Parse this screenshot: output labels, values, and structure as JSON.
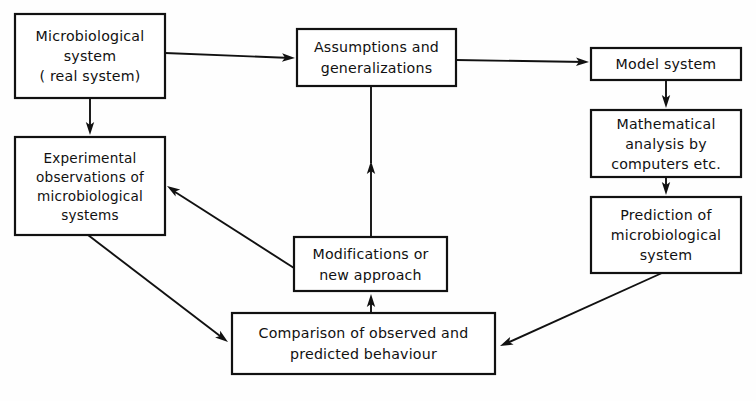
{
  "diagram": {
    "background_color": "#fefefe",
    "line_color": "#111111",
    "box_fill": "#ffffff",
    "nodes": [
      {
        "id": "microbiological-system",
        "lines": [
          "Microbiological",
          "system",
          "( real  system)"
        ],
        "x": 15,
        "y": 14,
        "w": 150,
        "h": 84
      },
      {
        "id": "assumptions-generalizations",
        "lines": [
          "Assumptions  and",
          "generalizations"
        ],
        "x": 297,
        "y": 29,
        "w": 159,
        "h": 57
      },
      {
        "id": "model-system",
        "lines": [
          "Model  system"
        ],
        "x": 591,
        "y": 48,
        "w": 150,
        "h": 32
      },
      {
        "id": "mathematical-analysis",
        "lines": [
          "Mathematical",
          "analysis by",
          "computers etc."
        ],
        "x": 591,
        "y": 110,
        "w": 150,
        "h": 67
      },
      {
        "id": "prediction-microbiological-system",
        "lines": [
          "Prediction of",
          "microbiological",
          "system"
        ],
        "x": 591,
        "y": 197,
        "w": 150,
        "h": 76
      },
      {
        "id": "experimental-observations",
        "lines": [
          "Experimental",
          "observations of",
          "microbiological",
          "systems"
        ],
        "x": 15,
        "y": 137,
        "w": 150,
        "h": 98
      },
      {
        "id": "modifications-new-approach",
        "lines": [
          "Modifications or",
          "new approach"
        ],
        "x": 294,
        "y": 237,
        "w": 153,
        "h": 54
      },
      {
        "id": "comparison-observed-predicted",
        "lines": [
          "Comparison of observed and",
          "predicted behaviour"
        ],
        "x": 232,
        "y": 313,
        "w": 263,
        "h": 61
      }
    ],
    "edges": [
      {
        "id": "edge-microbiological-to-assumptions",
        "from": "microbiological-system",
        "to": "assumptions-generalizations",
        "path": "M 165 53 L 291 58",
        "arrow_at": [
          295,
          58
        ],
        "arrow_angle": 2
      },
      {
        "id": "edge-microbiological-to-experimental",
        "from": "microbiological-system",
        "to": "experimental-observations",
        "path": "M 90 98 L 90 131",
        "arrow_at": [
          90,
          135
        ],
        "arrow_angle": 90
      },
      {
        "id": "edge-assumptions-to-model",
        "from": "assumptions-generalizations",
        "to": "model-system",
        "path": "M 456 60 L 585 62",
        "arrow_at": [
          589,
          62
        ],
        "arrow_angle": 1
      },
      {
        "id": "edge-model-to-mathematical",
        "from": "model-system",
        "to": "mathematical-analysis",
        "path": "M 666 80 L 666 104",
        "arrow_at": [
          666,
          108
        ],
        "arrow_angle": 90
      },
      {
        "id": "edge-mathematical-to-prediction",
        "from": "mathematical-analysis",
        "to": "prediction-microbiological-system",
        "path": "M 666 177 L 666 191",
        "arrow_at": [
          666,
          195
        ],
        "arrow_angle": 90
      },
      {
        "id": "edge-prediction-to-comparison",
        "from": "prediction-microbiological-system",
        "to": "comparison-observed-predicted",
        "path": "M 662 273 L 505 344",
        "arrow_at": [
          500,
          346
        ],
        "arrow_angle": 156
      },
      {
        "id": "edge-experimental-to-comparison",
        "from": "experimental-observations",
        "to": "comparison-observed-predicted",
        "path": "M 88 235 L 224 339",
        "arrow_at": [
          228,
          342
        ],
        "arrow_angle": 37
      },
      {
        "id": "edge-comparison-to-modifications",
        "from": "comparison-observed-predicted",
        "to": "modifications-new-approach",
        "path": "M 371 313 L 371 300",
        "arrow_at": [
          371,
          294
        ],
        "arrow_angle": -90
      },
      {
        "id": "edge-modifications-to-experimental",
        "from": "modifications-new-approach",
        "to": "experimental-observations",
        "path": "M 294 268 L 172 190",
        "arrow_at": [
          167,
          186
        ],
        "arrow_angle": -147
      },
      {
        "id": "edge-modifications-to-assumptions",
        "from": "modifications-new-approach",
        "to": "assumptions-generalizations",
        "path": "M 371 237 L 371 167",
        "arrow_at": [
          371,
          161
        ],
        "arrow_angle": -90
      },
      {
        "id": "edge-assumptions-down-stem",
        "from": "assumptions-generalizations",
        "to": "modifications-new-approach",
        "path": "M 371 86 L 371 163",
        "arrow_at": null,
        "arrow_angle": 0
      }
    ]
  }
}
